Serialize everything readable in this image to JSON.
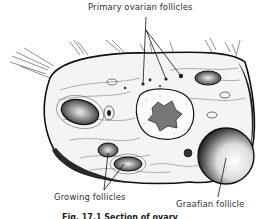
{
  "figure": {
    "type": "anatomical-illustration",
    "style": "black-and-white pen drawing"
  },
  "labels": {
    "primary_ovarian_follicles": "Primary ovarian follicles",
    "growing_follicles": "Growing follicles",
    "graafian_follicle": "Graafian follicle"
  },
  "caption": {
    "text": "Fig. 17.1 Section of ovary",
    "clipped": true
  },
  "colors": {
    "ink": "#1a1a1a",
    "paper": "#ffffff",
    "tissue": "#f2f2f2"
  }
}
